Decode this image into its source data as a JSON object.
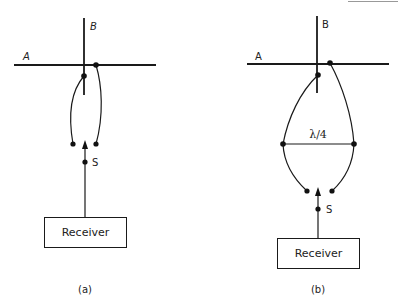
{
  "figure": {
    "panels": [
      {
        "id": "a",
        "caption": "(a)",
        "line_a_label": "A",
        "line_b_label": "B",
        "source_label": "S",
        "receiver_label": "Receiver"
      },
      {
        "id": "b",
        "caption": "(b)",
        "line_a_label": "A",
        "line_b_label": "B",
        "source_label": "S",
        "receiver_label": "Receiver",
        "quarter_wave_label": "λ/4"
      }
    ]
  },
  "colors": {
    "line": "#1a1a1a",
    "background": "#ffffff"
  }
}
